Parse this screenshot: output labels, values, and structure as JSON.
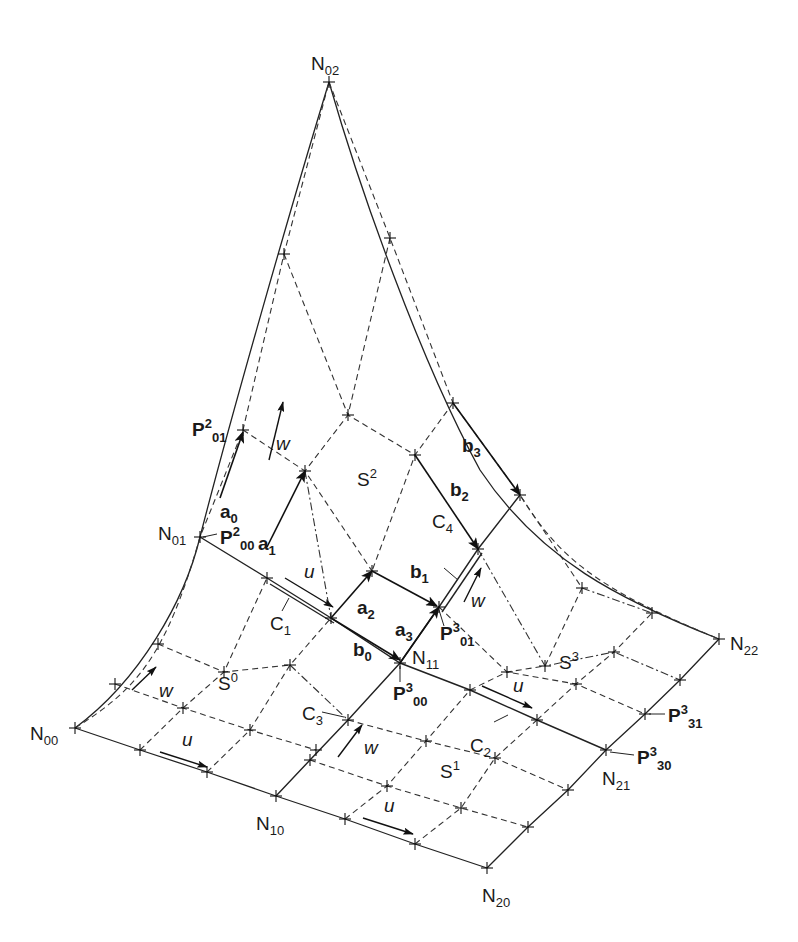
{
  "figure": {
    "type": "surface-patch-construction"
  },
  "nodes": [
    {
      "id": "N00",
      "base": "N",
      "sub": "00",
      "x": 75,
      "y": 728,
      "lx": 30,
      "ly": 740
    },
    {
      "id": "N10",
      "base": "N",
      "sub": "10",
      "x": 276,
      "y": 796,
      "lx": 256,
      "ly": 830
    },
    {
      "id": "N20",
      "base": "N",
      "sub": "20",
      "x": 487,
      "y": 868,
      "lx": 482,
      "ly": 902
    },
    {
      "id": "N01",
      "base": "N",
      "sub": "01",
      "x": 200,
      "y": 537,
      "lx": 158,
      "ly": 540
    },
    {
      "id": "N11",
      "base": "N",
      "sub": "11",
      "x": 400,
      "y": 663,
      "lx": 412,
      "ly": 664
    },
    {
      "id": "N21",
      "base": "N",
      "sub": "21",
      "x": 606,
      "y": 750,
      "lx": 602,
      "ly": 785
    },
    {
      "id": "N02",
      "base": "N",
      "sub": "02",
      "x": 329,
      "y": 82,
      "lx": 311,
      "ly": 70
    },
    {
      "id": "N22",
      "base": "N",
      "sub": "22",
      "x": 719,
      "y": 639,
      "lx": 730,
      "ly": 650
    }
  ],
  "points": [
    {
      "id": "P200",
      "base": "P",
      "sup": "2",
      "sub": "00",
      "x": 200,
      "y": 537,
      "lx": 220,
      "ly": 544,
      "leader": [
        203,
        537,
        217,
        534
      ]
    },
    {
      "id": "P201",
      "base": "P",
      "sup": "2",
      "sub": "01",
      "x": 243,
      "y": 430,
      "lx": 192,
      "ly": 436,
      "leader": null
    },
    {
      "id": "P300",
      "base": "P",
      "sup": "3",
      "sub": "00",
      "x": 400,
      "y": 663,
      "lx": 393,
      "ly": 700,
      "leader": [
        400,
        666,
        400,
        682
      ]
    },
    {
      "id": "P301",
      "base": "P",
      "sup": "3",
      "sub": "01",
      "x": 439,
      "y": 607,
      "lx": 440,
      "ly": 640,
      "leader": [
        439,
        610,
        444,
        626
      ]
    },
    {
      "id": "P330",
      "base": "P",
      "sup": "3",
      "sub": "30",
      "x": 606,
      "y": 750,
      "lx": 637,
      "ly": 764,
      "leader": [
        610,
        752,
        634,
        755
      ]
    },
    {
      "id": "P331",
      "base": "P",
      "sup": "3",
      "sub": "31",
      "x": 645,
      "y": 714,
      "lx": 668,
      "ly": 722,
      "leader": [
        649,
        714,
        665,
        714
      ]
    }
  ],
  "patches": [
    {
      "id": "S0",
      "base": "S",
      "sup": "0",
      "x": 218,
      "y": 690
    },
    {
      "id": "S1",
      "base": "S",
      "sup": "1",
      "x": 440,
      "y": 778
    },
    {
      "id": "S2",
      "base": "S",
      "sup": "2",
      "x": 357,
      "y": 486
    },
    {
      "id": "S3",
      "base": "S",
      "sup": "3",
      "x": 559,
      "y": 669
    }
  ],
  "curves": [
    {
      "id": "C1",
      "base": "C",
      "sub": "1",
      "lx": 270,
      "ly": 630,
      "leader": [
        289,
        598,
        282,
        611
      ]
    },
    {
      "id": "C2",
      "base": "C",
      "sub": "2",
      "lx": 470,
      "ly": 752,
      "leader": [
        508,
        715,
        494,
        722
      ]
    },
    {
      "id": "C3",
      "base": "C",
      "sub": "3",
      "lx": 302,
      "ly": 720,
      "leader": [
        322,
        712,
        344,
        717
      ]
    },
    {
      "id": "C4",
      "base": "C",
      "sub": "4",
      "lx": 432,
      "ly": 528,
      "leader": [
        444,
        568,
        458,
        580
      ]
    }
  ],
  "vectors": [
    {
      "id": "a0",
      "base": "a",
      "sub": "0",
      "x1": 220,
      "y1": 498,
      "x2": 243,
      "y2": 432,
      "lx": 220,
      "ly": 518
    },
    {
      "id": "a1",
      "base": "a",
      "sub": "1",
      "x1": 267,
      "y1": 547,
      "x2": 305,
      "y2": 471,
      "lx": 258,
      "ly": 550
    },
    {
      "id": "a2",
      "base": "a",
      "sub": "2",
      "x1": 331,
      "y1": 618,
      "x2": 372,
      "y2": 571,
      "lx": 357,
      "ly": 614
    },
    {
      "id": "a3",
      "base": "a",
      "sub": "3",
      "x1": 400,
      "y1": 663,
      "x2": 439,
      "y2": 607,
      "lx": 395,
      "ly": 636
    },
    {
      "id": "b0",
      "base": "b",
      "sub": "0",
      "x1": 331,
      "y1": 618,
      "x2": 400,
      "y2": 660,
      "lx": 353,
      "ly": 656
    },
    {
      "id": "b1",
      "base": "b",
      "sub": "1",
      "x1": 372,
      "y1": 571,
      "x2": 437,
      "y2": 606,
      "lx": 410,
      "ly": 578
    },
    {
      "id": "b2",
      "base": "b",
      "sub": "2",
      "x1": 415,
      "y1": 455,
      "x2": 478,
      "y2": 549,
      "lx": 450,
      "ly": 496
    },
    {
      "id": "b3",
      "base": "b",
      "sub": "3",
      "x1": 453,
      "y1": 403,
      "x2": 520,
      "y2": 495,
      "lx": 462,
      "ly": 452
    }
  ],
  "direction_arrows": [
    {
      "label": "w",
      "x1": 269,
      "y1": 460,
      "x2": 283,
      "y2": 402,
      "lx": 276,
      "ly": 450
    },
    {
      "label": "u",
      "x1": 285,
      "y1": 578,
      "x2": 333,
      "y2": 607,
      "lx": 304,
      "ly": 578
    },
    {
      "label": "w",
      "x1": 464,
      "y1": 602,
      "x2": 481,
      "y2": 568,
      "lx": 471,
      "ly": 607
    },
    {
      "label": "w",
      "x1": 132,
      "y1": 690,
      "x2": 156,
      "y2": 667,
      "lx": 159,
      "ly": 697
    },
    {
      "label": "u",
      "x1": 160,
      "y1": 752,
      "x2": 207,
      "y2": 767,
      "lx": 182,
      "ly": 746
    },
    {
      "label": "w",
      "x1": 338,
      "y1": 757,
      "x2": 362,
      "y2": 725,
      "lx": 364,
      "ly": 754
    },
    {
      "label": "u",
      "x1": 482,
      "y1": 686,
      "x2": 532,
      "y2": 708,
      "lx": 513,
      "ly": 692
    },
    {
      "label": "u",
      "x1": 363,
      "y1": 818,
      "x2": 413,
      "y2": 834,
      "lx": 384,
      "ly": 812
    }
  ],
  "colors": {
    "ink": "#1a1a1a",
    "background": "#ffffff"
  }
}
